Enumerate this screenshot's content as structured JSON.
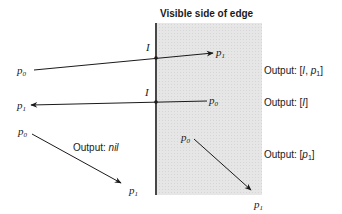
{
  "title": "Visible side of edge",
  "colors": {
    "shade": "#e4e4e4",
    "ink": "#1a1a1a",
    "background": "#ffffff"
  },
  "edge": {
    "x": 156,
    "y1": 23,
    "y2": 195
  },
  "shaded_region": {
    "x": 157,
    "y": 23,
    "width": 105,
    "height": 172
  },
  "cases": [
    {
      "p0": {
        "label": "p",
        "sub": "0"
      },
      "p1": {
        "label": "p",
        "sub": "1"
      },
      "intersection_label": "I",
      "output_prefix": "Output: [",
      "output_i": "I",
      "output_sep": ", ",
      "output_p": "p",
      "output_sub": "1",
      "output_suffix": "]"
    },
    {
      "p0": {
        "label": "p",
        "sub": "0"
      },
      "p1": {
        "label": "p",
        "sub": "1"
      },
      "intersection_label": "I",
      "output_prefix": "Output: [",
      "output_i": "I",
      "output_suffix": "]"
    },
    {
      "p0": {
        "label": "p",
        "sub": "0"
      },
      "p1": {
        "label": "p",
        "sub": "1"
      },
      "output_prefix": "Output: ",
      "output_value": "nil"
    },
    {
      "p0": {
        "label": "p",
        "sub": "0"
      },
      "p1": {
        "label": "p",
        "sub": "1"
      },
      "output_prefix": "Output: [",
      "output_p": "p",
      "output_sub": "1",
      "output_suffix": "]"
    }
  ]
}
